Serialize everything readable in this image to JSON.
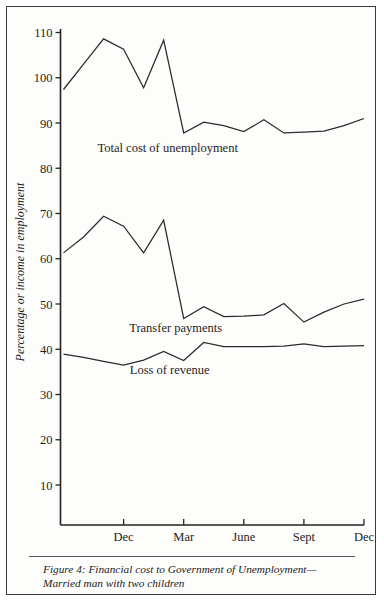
{
  "figure": {
    "caption": "Figure 4: Financial cost to Government of Unemployment—Married man with two children"
  },
  "chart_data": {
    "type": "line",
    "title": "",
    "xlabel": "",
    "ylabel": "Percentage or income in employment",
    "ylim": [
      0,
      112
    ],
    "yticks": [
      10,
      20,
      30,
      40,
      50,
      60,
      70,
      80,
      90,
      100,
      110
    ],
    "ytick_labels": [
      "10",
      "20",
      "30",
      "40",
      "50",
      "60",
      "70",
      "80",
      "90",
      "100",
      "110"
    ],
    "grid": false,
    "legend_position": "inline-annotations",
    "x": [
      0,
      1,
      2,
      3,
      4,
      5,
      6,
      7,
      8,
      9,
      10,
      11,
      12,
      13,
      14,
      15
    ],
    "xticks": [
      3,
      6,
      9,
      12,
      15
    ],
    "xtick_labels": [
      "Dec",
      "Mar",
      "June",
      "Sept",
      "Dec"
    ],
    "xtick_years": [
      "1977",
      "",
      "1978",
      "",
      ""
    ],
    "series": [
      {
        "name": "Total cost of unemployment",
        "values": [
          97.4,
          103.0,
          108.6,
          106.3,
          97.8,
          108.3,
          87.8,
          90.2,
          89.4,
          88.1,
          90.7,
          87.8,
          88.0,
          88.2,
          89.4,
          91.0
        ],
        "label_x": 5.2,
        "label_y": 83.5
      },
      {
        "name": "Transfer payments",
        "values": [
          61.3,
          64.8,
          69.4,
          67.2,
          61.3,
          68.5,
          46.8,
          49.4,
          47.2,
          47.3,
          47.6,
          50.1,
          46.0,
          48.2,
          50.0,
          51.1
        ],
        "label_x": 5.6,
        "label_y": 43.8
      },
      {
        "name": "Loss of revenue",
        "values": [
          38.9,
          38.2,
          37.3,
          36.5,
          37.6,
          39.5,
          37.5,
          41.5,
          40.6,
          40.6,
          40.6,
          40.7,
          41.2,
          40.6,
          40.7,
          40.8
        ],
        "label_x": 5.3,
        "label_y": 34.5
      }
    ],
    "annotations": [
      {
        "text": "Total cost of unemployment",
        "series": 0
      },
      {
        "text": "Transfer payments",
        "series": 1
      },
      {
        "text": "Loss of revenue",
        "series": 2
      }
    ],
    "colors": {
      "line": "#2b2b2b",
      "axis": "#222222",
      "text": "#1d1d1d",
      "background": "#fdfdfb",
      "frame": "#3a3a3a"
    }
  }
}
